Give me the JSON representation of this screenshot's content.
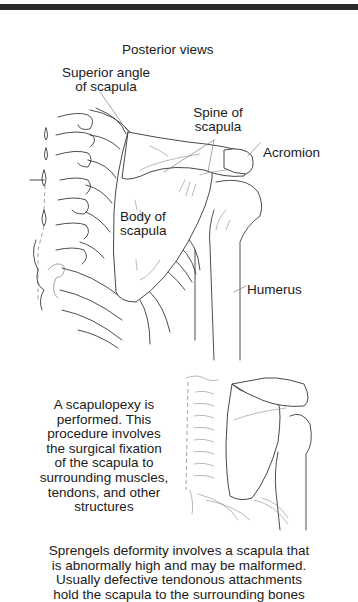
{
  "figure": {
    "title": "Posterior views",
    "labels": {
      "superior_angle": [
        "Superior angle",
        "of scapula"
      ],
      "spine": [
        "Spine of",
        "scapula"
      ],
      "acromion": "Acromion",
      "body": [
        "Body of",
        "scapula"
      ],
      "humerus": "Humerus"
    },
    "procedure_caption": [
      "A scapulopexy is",
      "performed. This",
      "procedure involves",
      "the surgical fixation",
      "of the scapula to",
      "surrounding muscles,",
      "tendons, and other",
      "structures"
    ],
    "footer_caption": [
      "Sprengels deformity involves a scapula that",
      "is abnormally high and may be malformed.",
      "Usually defective tendonous attachments",
      "hold the scapula to the surrounding bones"
    ]
  }
}
